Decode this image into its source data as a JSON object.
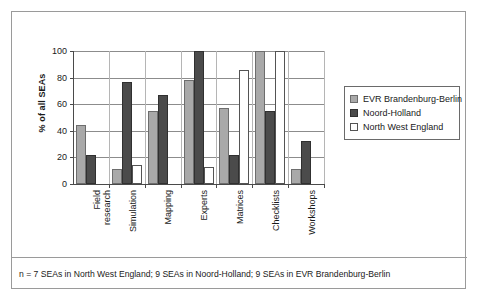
{
  "chart_data": {
    "type": "bar",
    "title": "",
    "xlabel": "",
    "ylabel": "% of all SEAs",
    "ylim": [
      0,
      100
    ],
    "yticks": [
      0,
      20,
      40,
      60,
      80,
      100
    ],
    "grid": true,
    "legend_position": "right",
    "categories": [
      "Field research",
      "Simulation",
      "Mapping",
      "Experts",
      "Matrices",
      "Checklists",
      "Workshops"
    ],
    "category_lines": [
      [
        "Field",
        "research"
      ],
      [
        "Simulation"
      ],
      [
        "Mapping"
      ],
      [
        "Experts"
      ],
      [
        "Matrices"
      ],
      [
        "Checklists"
      ],
      [
        "Workshops"
      ]
    ],
    "series": [
      {
        "name": "EVR Brandenburg-Berlin",
        "color": "#a9a9a9",
        "values": [
          44,
          11,
          55,
          78,
          57,
          100,
          11
        ]
      },
      {
        "name": "Noord-Holland",
        "color": "#4b4b4b",
        "values": [
          22,
          77,
          67,
          100,
          22,
          55,
          32
        ]
      },
      {
        "name": "North West England",
        "color": "#ffffff",
        "values": [
          0,
          14,
          0,
          13,
          86,
          100,
          0
        ]
      }
    ]
  },
  "caption": {
    "text": "n = 7 SEAs in North West England; 9 SEAs in Noord-Holland; 9 SEAs in EVR Brandenburg-Berlin"
  }
}
